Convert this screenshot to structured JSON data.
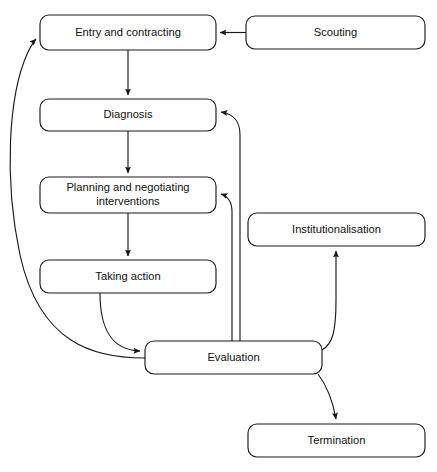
{
  "diagram": {
    "type": "flowchart",
    "background_color": "#ffffff",
    "stroke_color": "#1a1a1a",
    "node_fill_color": "#ffffff",
    "nodes": [
      {
        "id": "entry",
        "label": "Entry and contracting",
        "lines": [
          "Entry and contracting"
        ],
        "x": 40,
        "y": 15,
        "w": 176,
        "h": 35
      },
      {
        "id": "scouting",
        "label": "Scouting",
        "lines": [
          "Scouting"
        ],
        "x": 246,
        "y": 16,
        "w": 179,
        "h": 33
      },
      {
        "id": "diagnosis",
        "label": "Diagnosis",
        "lines": [
          "Diagnosis"
        ],
        "x": 40,
        "y": 99,
        "w": 176,
        "h": 32
      },
      {
        "id": "planning",
        "label": "Planning and negotiating interventions",
        "lines": [
          "Planning and negotiating",
          "interventions"
        ],
        "x": 40,
        "y": 177,
        "w": 176,
        "h": 36
      },
      {
        "id": "taking_action",
        "label": "Taking action",
        "lines": [
          "Taking action"
        ],
        "x": 40,
        "y": 260,
        "w": 176,
        "h": 33
      },
      {
        "id": "institutionalisation",
        "label": "Institutionalisation",
        "lines": [
          "Institutionalisation"
        ],
        "x": 248,
        "y": 213,
        "w": 177,
        "h": 33
      },
      {
        "id": "evaluation",
        "label": "Evaluation",
        "lines": [
          "Evaluation"
        ],
        "x": 145,
        "y": 341,
        "w": 177,
        "h": 33
      },
      {
        "id": "termination",
        "label": "Termination",
        "lines": [
          "Termination"
        ],
        "x": 248,
        "y": 424,
        "w": 177,
        "h": 33
      }
    ],
    "edges": [
      {
        "id": "scouting-to-entry",
        "from": "scouting",
        "to": "entry",
        "arrow": true
      },
      {
        "id": "entry-to-diagnosis",
        "from": "entry",
        "to": "diagnosis",
        "arrow": true
      },
      {
        "id": "diagnosis-to-planning",
        "from": "diagnosis",
        "to": "planning",
        "arrow": true
      },
      {
        "id": "planning-to-taking-action",
        "from": "planning",
        "to": "taking_action",
        "arrow": true
      },
      {
        "id": "taking-action-to-evaluation",
        "from": "taking_action",
        "to": "evaluation",
        "arrow": true
      },
      {
        "id": "evaluation-to-diagnosis",
        "from": "evaluation",
        "to": "diagnosis",
        "arrow": true
      },
      {
        "id": "evaluation-to-planning",
        "from": "evaluation",
        "to": "planning",
        "arrow": true
      },
      {
        "id": "evaluation-to-entry",
        "from": "evaluation",
        "to": "entry",
        "arrow": true
      },
      {
        "id": "evaluation-to-institutionalisation",
        "from": "evaluation",
        "to": "institutionalisation",
        "arrow": true
      },
      {
        "id": "evaluation-to-termination",
        "from": "evaluation",
        "to": "termination",
        "arrow": true
      }
    ]
  }
}
